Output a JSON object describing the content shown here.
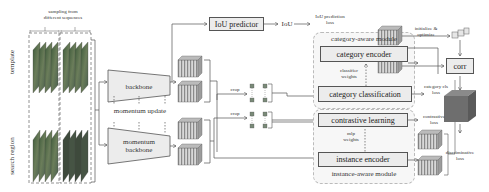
{
  "diagram": {
    "inputs": {
      "sampling_label_line1": "sampling from",
      "sampling_label_line2": "different sequences",
      "template_label": "template",
      "search_region_label": "search region"
    },
    "backbone": {
      "backbone_label": "backbone",
      "momentum_update_label": "momentum update",
      "momentum_backbone_line1": "momentum",
      "momentum_backbone_line2": "backbone"
    },
    "iou": {
      "predictor_label": "IoU predictor",
      "iou_label": "IoU",
      "loss_line1": "IoU prediction",
      "loss_line2": "loss"
    },
    "crop_labels": [
      "crop",
      "crop"
    ],
    "category_module": {
      "title": "category-aware module",
      "encoder_label": "category encoder",
      "classifier_weights_line1": "classifier",
      "classifier_weights_line2": "weights",
      "classification_label": "category classification",
      "cls_loss_line1": "category cls",
      "cls_loss_line2": "loss"
    },
    "instance_module": {
      "title": "instance-aware module",
      "contrastive_label": "contrastive learning",
      "mlp_weights_line1": "mlp",
      "mlp_weights_line2": "weights",
      "encoder_label": "instance encoder",
      "contrastive_loss_line1": "contrastive",
      "contrastive_loss_line2": "loss"
    },
    "right": {
      "init_line1": "initialize &",
      "init_line2": "optimize",
      "corr_label": "corr",
      "disc_loss_line1": "discriminative",
      "disc_loss_line2": "loss"
    },
    "colors": {
      "box_fill": "#ececec",
      "module_fill": "#f7f7f7",
      "feature_stripe": "#8a8a8a",
      "response_fill": "#6e6e6e",
      "image_green": "#4f6b4a"
    }
  }
}
